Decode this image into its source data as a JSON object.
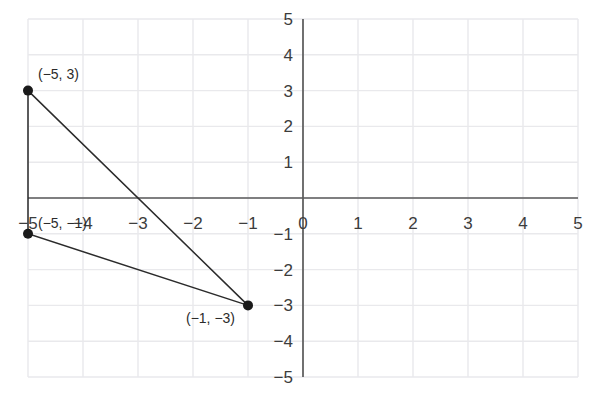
{
  "figure": {
    "background_color": "#ffffff",
    "grid_color": "#e9e9ec",
    "axis_color": "#5a5a5a",
    "shape_line_color": "#2b2b2b",
    "point_color": "#1a1a1a",
    "tick_label_color": "#3c3c3c",
    "point_label_color": "#2b2b2b"
  },
  "chart_data": {
    "type": "scatter",
    "title": "",
    "xlabel": "",
    "ylabel": "",
    "xlim": [
      -5,
      5
    ],
    "ylim": [
      -5,
      5
    ],
    "xticks": [
      -5,
      -4,
      -3,
      -2,
      -1,
      0,
      1,
      2,
      3,
      4,
      5
    ],
    "yticks": [
      -5,
      -4,
      -3,
      -2,
      -1,
      0,
      1,
      2,
      3,
      4,
      5
    ],
    "xtick_labels": [
      "−5",
      "−4",
      "−3",
      "−2",
      "−1",
      "0",
      "1",
      "2",
      "3",
      "4",
      "5"
    ],
    "ytick_labels": [
      "−5",
      "−4",
      "−3",
      "−2",
      "−1",
      "0",
      "1",
      "2",
      "3",
      "4",
      "5"
    ],
    "grid": true,
    "legend": null,
    "axes_through_origin": true,
    "points": [
      {
        "name": "vertex-a",
        "x": -5,
        "y": 3,
        "label": "(−5, 3)",
        "label_dx": 10,
        "label_dy": -12
      },
      {
        "name": "vertex-b",
        "x": -5,
        "y": -1,
        "label": "(−5, −1)",
        "label_dx": 10,
        "label_dy": -6
      },
      {
        "name": "vertex-c",
        "x": -1,
        "y": -3,
        "label": "(−1, −3)",
        "label_dx": -62,
        "label_dy": 18
      }
    ],
    "shapes": [
      {
        "name": "triangle",
        "type": "polygon",
        "closed": true,
        "vertices": [
          [
            -5,
            3
          ],
          [
            -1,
            -3
          ],
          [
            -5,
            -1
          ]
        ],
        "fill": "none",
        "stroke": "#2b2b2b"
      }
    ],
    "annotations": [
      {
        "text": "(−5, 3)",
        "x": -5,
        "y": 3
      },
      {
        "text": "(−5, −1)",
        "x": -5,
        "y": -1
      },
      {
        "text": "(−1, −3)",
        "x": -1,
        "y": -3
      }
    ]
  }
}
